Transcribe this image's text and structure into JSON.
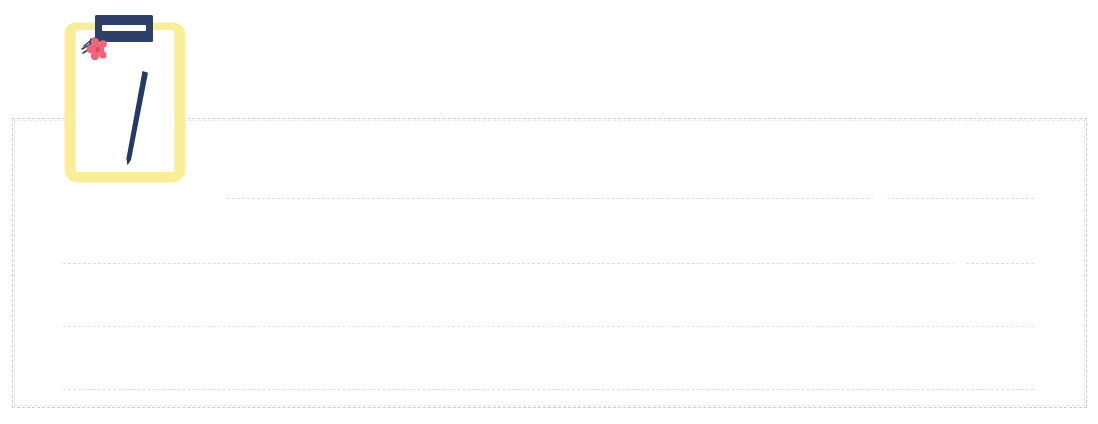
{
  "canvas": {
    "width": 1098,
    "height": 424,
    "background": "#ffffff"
  },
  "note_card": {
    "label": "Lined note area",
    "value": "",
    "placeholder": "",
    "border_color": "#bcd2e3",
    "border_style": "dashed",
    "x": 12,
    "y": 118,
    "width": 1075,
    "height": 290,
    "rule_color": "#cfdfec",
    "rules": [
      {
        "name": "rule-line-1",
        "x": 226,
        "y": 197,
        "width": 807,
        "soft": false,
        "gap_x": 872,
        "gap_w": 14
      },
      {
        "name": "rule-line-2",
        "x": 62,
        "y": 262,
        "width": 971,
        "soft": false,
        "gap_x": 952,
        "gap_w": 12
      },
      {
        "name": "rule-line-3",
        "x": 62,
        "y": 325,
        "width": 971,
        "soft": true,
        "gap_x": 0,
        "gap_w": 0
      },
      {
        "name": "rule-line-4",
        "x": 62,
        "y": 388,
        "width": 971,
        "soft": false,
        "gap_x": 0,
        "gap_w": 0
      }
    ]
  },
  "clipboard": {
    "alt_text": "Clipboard with blank paper, pencil and a pink flower",
    "frame_color": "#f8ee96",
    "paper_color": "#ffffff",
    "clip_color": "#2d4068",
    "clip_bar_color": "#ffffff",
    "pencil_color": "#243a63",
    "flower_color": "#f2627a",
    "flower_center_color": "#d8455f",
    "stem_color": "#2d4068",
    "x": 58,
    "y": 8,
    "width": 140,
    "height": 180
  }
}
